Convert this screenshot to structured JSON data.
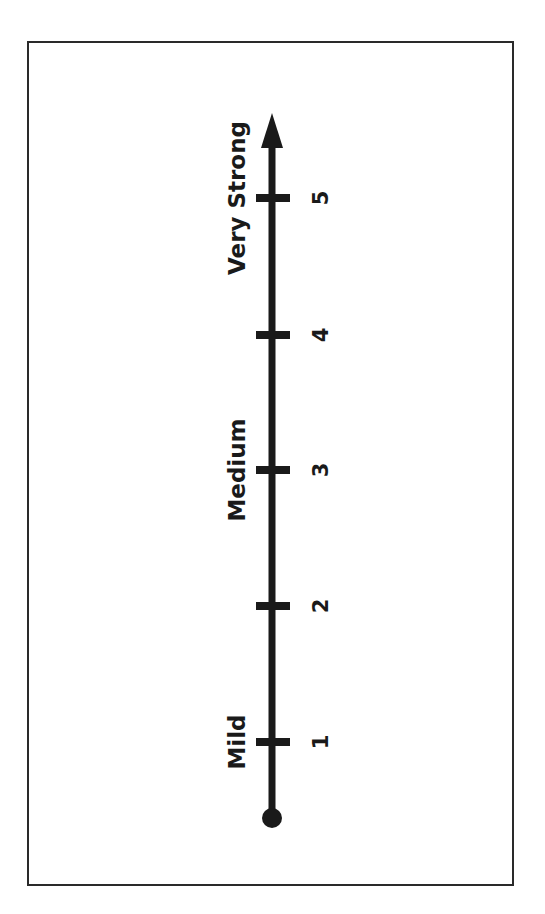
{
  "scale": {
    "title": "",
    "ticks": [
      {
        "value": "1",
        "y": 742
      },
      {
        "value": "2",
        "y": 606
      },
      {
        "value": "3",
        "y": 470
      },
      {
        "value": "4",
        "y": 335
      },
      {
        "value": "5",
        "y": 198
      }
    ],
    "labels": [
      {
        "text": "Mild",
        "y": 742
      },
      {
        "text": "Medium",
        "y": 470
      },
      {
        "text": "Very Strong",
        "y": 198
      }
    ],
    "colors": {
      "line": "#1a1a1a",
      "frame": "#2a2a2a",
      "background": "#ffffff"
    }
  }
}
